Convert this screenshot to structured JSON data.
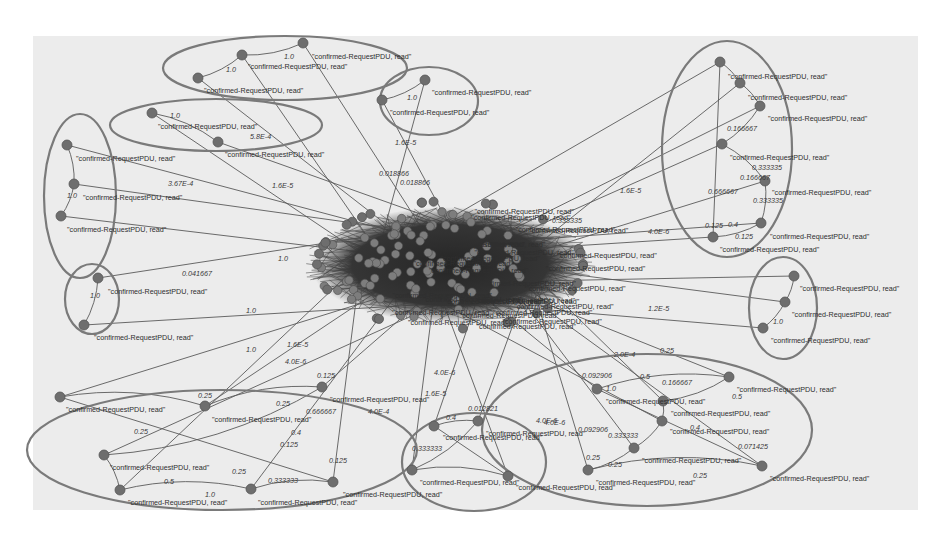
{
  "diagram": {
    "type": "directed-graph",
    "node_label_default": "\"confirmed-RequestPDU, read\"",
    "colors": {
      "background": "#ffffff",
      "panel": "#ececec",
      "node_fill": "#6e6e6e",
      "edge": "#5a5a5a",
      "cluster_outline": "#7a7a7a",
      "hub_dense": "#2e2e2e"
    },
    "clusters": [
      {
        "id": "c-top-center",
        "cx": 285,
        "cy": 68,
        "rx": 122,
        "ry": 32
      },
      {
        "id": "c-top-mid",
        "cx": 429,
        "cy": 101,
        "rx": 49,
        "ry": 34
      },
      {
        "id": "c-left-upper",
        "cx": 216,
        "cy": 125,
        "rx": 106,
        "ry": 26
      },
      {
        "id": "c-left",
        "cx": 80,
        "cy": 196,
        "rx": 36,
        "ry": 82
      },
      {
        "id": "c-left-small",
        "cx": 92,
        "cy": 299,
        "rx": 27,
        "ry": 35
      },
      {
        "id": "c-right-tall",
        "cx": 727,
        "cy": 149,
        "rx": 65,
        "ry": 108
      },
      {
        "id": "c-right-small",
        "cx": 783,
        "cy": 308,
        "rx": 34,
        "ry": 51
      },
      {
        "id": "c-bottom-left",
        "cx": 222,
        "cy": 450,
        "rx": 195,
        "ry": 60
      },
      {
        "id": "c-bottom-mid",
        "cx": 474,
        "cy": 462,
        "rx": 72,
        "ry": 49
      },
      {
        "id": "c-bottom-right",
        "cx": 647,
        "cy": 430,
        "rx": 165,
        "ry": 76
      }
    ],
    "nodes": [
      {
        "id": "n1",
        "x": 303,
        "y": 43,
        "label": "\"confirmed-RequestPDU, read\"",
        "lx": 312,
        "ly": 59
      },
      {
        "id": "n2",
        "x": 242,
        "y": 55,
        "label": "\"confirmed-RequestPDU, read\"",
        "lx": 248,
        "ly": 69
      },
      {
        "id": "n3",
        "x": 198,
        "y": 78,
        "label": "\"confirmed-RequestPDU, read\"",
        "lx": 204,
        "ly": 93
      },
      {
        "id": "n4",
        "x": 425,
        "y": 80,
        "label": "\"confirmed-RequestPDU, read\"",
        "lx": 432,
        "ly": 95
      },
      {
        "id": "n5",
        "x": 382,
        "y": 100,
        "label": "\"confirmed-RequestPDU, read\"",
        "lx": 390,
        "ly": 115
      },
      {
        "id": "n6",
        "x": 152,
        "y": 113,
        "label": "\"confirmed-RequestPDU, read\"",
        "lx": 158,
        "ly": 129
      },
      {
        "id": "n7",
        "x": 218,
        "y": 142,
        "label": "\"confirmed-RequestPDU, read\"",
        "lx": 225,
        "ly": 157
      },
      {
        "id": "n8",
        "x": 67,
        "y": 145,
        "label": "\"confirmed-RequestPDU, read\"",
        "lx": 76,
        "ly": 161
      },
      {
        "id": "n9",
        "x": 74,
        "y": 184,
        "label": "\"confirmed-RequestPDU, read\"",
        "lx": 83,
        "ly": 200
      },
      {
        "id": "n10",
        "x": 61,
        "y": 216,
        "label": "\"confirmed-RequestPDU, read\"",
        "lx": 67,
        "ly": 232
      },
      {
        "id": "n11",
        "x": 98,
        "y": 278,
        "label": "\"confirmed-RequestPDU, read\"",
        "lx": 108,
        "ly": 294
      },
      {
        "id": "n12",
        "x": 84,
        "y": 325,
        "label": "\"confirmed-RequestPDU, read\"",
        "lx": 94,
        "ly": 340
      },
      {
        "id": "n13",
        "x": 720,
        "y": 62,
        "label": "\"confirmed-RequestPDU, read\"",
        "lx": 728,
        "ly": 79
      },
      {
        "id": "n14",
        "x": 740,
        "y": 83,
        "label": "\"confirmed-RequestPDU, read\"",
        "lx": 748,
        "ly": 100
      },
      {
        "id": "n15",
        "x": 760,
        "y": 106,
        "label": "\"confirmed-RequestPDU, read\"",
        "lx": 768,
        "ly": 121
      },
      {
        "id": "n16",
        "x": 722,
        "y": 144,
        "label": "\"confirmed-RequestPDU, read\"",
        "lx": 730,
        "ly": 160
      },
      {
        "id": "n17",
        "x": 765,
        "y": 181,
        "label": "\"confirmed-RequestPDU, read\"",
        "lx": 772,
        "ly": 195
      },
      {
        "id": "n18",
        "x": 761,
        "y": 223,
        "label": "\"confirmed-RequestPDU, read\"",
        "lx": 770,
        "ly": 239
      },
      {
        "id": "n19",
        "x": 713,
        "y": 237,
        "label": "\"confirmed-RequestPDU, read\"",
        "lx": 720,
        "ly": 252
      },
      {
        "id": "n20",
        "x": 794,
        "y": 276,
        "label": "\"confirmed-RequestPDU, read\"",
        "lx": 800,
        "ly": 291
      },
      {
        "id": "n21",
        "x": 785,
        "y": 302,
        "label": "\"confirmed-RequestPDU, read\"",
        "lx": 792,
        "ly": 317
      },
      {
        "id": "n22",
        "x": 763,
        "y": 328,
        "label": "\"confirmed-RequestPDU, read\"",
        "lx": 771,
        "ly": 343
      },
      {
        "id": "n23",
        "x": 60,
        "y": 397,
        "label": "\"confirmed-RequestPDU, read\"",
        "lx": 66,
        "ly": 412
      },
      {
        "id": "n24",
        "x": 205,
        "y": 406,
        "label": "\"confirmed-RequestPDU, read\"",
        "lx": 212,
        "ly": 422
      },
      {
        "id": "n25",
        "x": 322,
        "y": 387,
        "label": "\"confirmed-RequestPDU, read\"",
        "lx": 330,
        "ly": 402
      },
      {
        "id": "n26",
        "x": 104,
        "y": 455,
        "label": "\"confirmed-RequestPDU, read\"",
        "lx": 110,
        "ly": 470
      },
      {
        "id": "n27",
        "x": 120,
        "y": 490,
        "label": "\"confirmed-RequestPDU, read\"",
        "lx": 128,
        "ly": 505
      },
      {
        "id": "n28",
        "x": 251,
        "y": 489,
        "label": "\"confirmed-RequestPDU, read\"",
        "lx": 258,
        "ly": 505
      },
      {
        "id": "n29",
        "x": 333,
        "y": 482,
        "label": "\"confirmed-RequestPDU, read\"",
        "lx": 343,
        "ly": 497
      },
      {
        "id": "n30",
        "x": 434,
        "y": 426,
        "label": "\"confirmed-RequestPDU, read\"",
        "lx": 443,
        "ly": 440
      },
      {
        "id": "n31",
        "x": 478,
        "y": 421,
        "label": "\"confirmed-RequestPDU, read\"",
        "lx": 486,
        "ly": 436
      },
      {
        "id": "n32",
        "x": 412,
        "y": 470,
        "label": "\"confirmed-RequestPDU, read\"",
        "lx": 420,
        "ly": 485
      },
      {
        "id": "n33",
        "x": 508,
        "y": 476,
        "label": "\"confirmed-RequestPDU, read\"",
        "lx": 516,
        "ly": 490
      },
      {
        "id": "n34",
        "x": 597,
        "y": 389,
        "label": "\"confirmed-RequestPDU, read\"",
        "lx": 606,
        "ly": 404
      },
      {
        "id": "n35",
        "x": 729,
        "y": 377,
        "label": "\"confirmed-RequestPDU, read\"",
        "lx": 737,
        "ly": 392
      },
      {
        "id": "n36",
        "x": 663,
        "y": 401,
        "label": "\"confirmed-RequestPDU, read\"",
        "lx": 671,
        "ly": 416
      },
      {
        "id": "n37",
        "x": 662,
        "y": 421,
        "label": "\"confirmed-RequestPDU, read\"",
        "lx": 670,
        "ly": 434
      },
      {
        "id": "n38",
        "x": 634,
        "y": 448,
        "label": "\"confirmed-RequestPDU, read\"",
        "lx": 642,
        "ly": 463
      },
      {
        "id": "n39",
        "x": 588,
        "y": 470,
        "label": "\"confirmed-RequestPDU, read\"",
        "lx": 596,
        "ly": 485
      },
      {
        "id": "n40",
        "x": 762,
        "y": 466,
        "label": "\"confirmed-RequestPDU, read\"",
        "lx": 770,
        "ly": 481
      }
    ],
    "edge_labels": [
      {
        "text": "1.0",
        "x": 284,
        "y": 59
      },
      {
        "text": "1.0",
        "x": 226,
        "y": 72
      },
      {
        "text": "1.0",
        "x": 407,
        "y": 100
      },
      {
        "text": "1.0",
        "x": 170,
        "y": 118
      },
      {
        "text": "5.8E-4",
        "x": 250,
        "y": 139
      },
      {
        "text": "1.6E-5",
        "x": 395,
        "y": 145
      },
      {
        "text": "3.67E-4",
        "x": 168,
        "y": 186
      },
      {
        "text": "1.6E-5",
        "x": 272,
        "y": 188
      },
      {
        "text": "1.0",
        "x": 67,
        "y": 198
      },
      {
        "text": "0.018866",
        "x": 379,
        "y": 176
      },
      {
        "text": "0.018866",
        "x": 400,
        "y": 185
      },
      {
        "text": "1.0",
        "x": 278,
        "y": 261
      },
      {
        "text": "0.041667",
        "x": 182,
        "y": 276
      },
      {
        "text": "1.0",
        "x": 90,
        "y": 298
      },
      {
        "text": "1.0",
        "x": 246,
        "y": 313
      },
      {
        "text": "1.0",
        "x": 246,
        "y": 352
      },
      {
        "text": "1.6E-5",
        "x": 287,
        "y": 347
      },
      {
        "text": "4.0E-6",
        "x": 285,
        "y": 364
      },
      {
        "text": "0.125",
        "x": 317,
        "y": 378
      },
      {
        "text": "0.25",
        "x": 198,
        "y": 398
      },
      {
        "text": "0.25",
        "x": 276,
        "y": 406
      },
      {
        "text": "0.666667",
        "x": 306,
        "y": 414
      },
      {
        "text": "4.0E-4",
        "x": 368,
        "y": 414
      },
      {
        "text": "0.25",
        "x": 134,
        "y": 434
      },
      {
        "text": "0.4",
        "x": 291,
        "y": 435
      },
      {
        "text": "0.125",
        "x": 280,
        "y": 447
      },
      {
        "text": "0.25",
        "x": 232,
        "y": 474
      },
      {
        "text": "0.5",
        "x": 164,
        "y": 484
      },
      {
        "text": "0.333333",
        "x": 268,
        "y": 483
      },
      {
        "text": "0.125",
        "x": 329,
        "y": 463
      },
      {
        "text": "1.0",
        "x": 205,
        "y": 497
      },
      {
        "text": "1.6E-5",
        "x": 425,
        "y": 396
      },
      {
        "text": "4.0E-6",
        "x": 434,
        "y": 375
      },
      {
        "text": "0.4",
        "x": 446,
        "y": 420
      },
      {
        "text": "0.012821",
        "x": 468,
        "y": 411
      },
      {
        "text": "0.333333",
        "x": 412,
        "y": 451
      },
      {
        "text": "0.166667",
        "x": 727,
        "y": 131
      },
      {
        "text": "0.333335",
        "x": 752,
        "y": 170
      },
      {
        "text": "0.166667",
        "x": 740,
        "y": 180
      },
      {
        "text": "0.666667",
        "x": 708,
        "y": 194
      },
      {
        "text": "0.333335",
        "x": 753,
        "y": 203
      },
      {
        "text": "0.125",
        "x": 705,
        "y": 228
      },
      {
        "text": "0.4",
        "x": 728,
        "y": 227
      },
      {
        "text": "0.125",
        "x": 735,
        "y": 239
      },
      {
        "text": "4.0E-6",
        "x": 648,
        "y": 234
      },
      {
        "text": "1.6E-5",
        "x": 620,
        "y": 193
      },
      {
        "text": "0.333335",
        "x": 552,
        "y": 223
      },
      {
        "text": "1.2E-5",
        "x": 648,
        "y": 311
      },
      {
        "text": "1.0",
        "x": 773,
        "y": 324
      },
      {
        "text": "0.25",
        "x": 660,
        "y": 353
      },
      {
        "text": "2.0E-4",
        "x": 614,
        "y": 357
      },
      {
        "text": "0.092906",
        "x": 582,
        "y": 378
      },
      {
        "text": "0.5",
        "x": 640,
        "y": 379
      },
      {
        "text": "0.166667",
        "x": 662,
        "y": 385
      },
      {
        "text": "1.0",
        "x": 606,
        "y": 391
      },
      {
        "text": "0.5",
        "x": 732,
        "y": 399
      },
      {
        "text": "4.0E-6",
        "x": 544,
        "y": 425
      },
      {
        "text": "4.0E-6",
        "x": 536,
        "y": 423
      },
      {
        "text": "0.092906",
        "x": 578,
        "y": 432
      },
      {
        "text": "0.333333",
        "x": 608,
        "y": 438
      },
      {
        "text": "0.4",
        "x": 690,
        "y": 430
      },
      {
        "text": "0.071425",
        "x": 738,
        "y": 449
      },
      {
        "text": "0.25",
        "x": 608,
        "y": 467
      },
      {
        "text": "0.25",
        "x": 693,
        "y": 478
      },
      {
        "text": "0.25",
        "x": 586,
        "y": 460
      }
    ],
    "hub": {
      "cx": 450,
      "cy": 265,
      "rx": 140,
      "ry": 58,
      "description": "dense core of many interconnected nodes with overlapping labels"
    }
  }
}
